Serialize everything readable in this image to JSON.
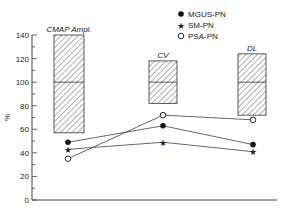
{
  "chart_data": {
    "type": "line",
    "title": "",
    "xlabel": "",
    "ylabel": "%",
    "ylim": [
      0,
      140
    ],
    "yticks": [
      0,
      20,
      40,
      60,
      80,
      100,
      120,
      140
    ],
    "categories": [
      "CMAP Ampl.",
      "CV",
      "DL"
    ],
    "reference_boxes": [
      {
        "label": "CMAP Ampl.",
        "top": 140,
        "median": 100,
        "bottom": 57
      },
      {
        "label": "CV",
        "top": 118,
        "median": 100,
        "bottom": 82
      },
      {
        "label": "DL",
        "top": 124,
        "median": 100,
        "bottom": 72
      }
    ],
    "series": [
      {
        "name": "MGUS-PN",
        "marker": "filled-circle",
        "values": [
          49,
          63,
          47
        ]
      },
      {
        "name": "SM-PN",
        "marker": "star",
        "values": [
          43,
          49,
          41
        ]
      },
      {
        "name": "PSA-PN",
        "marker": "open-circle",
        "values": [
          35,
          72,
          68
        ]
      }
    ],
    "legend_position": "top-right",
    "grid": false
  }
}
